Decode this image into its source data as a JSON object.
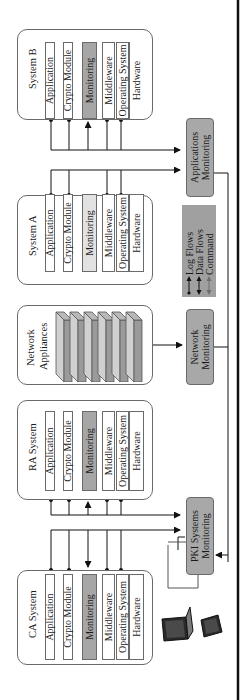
{
  "diagram": {
    "orientation": "rotated-90-ccw",
    "systems": [
      {
        "id": "system_b",
        "title": "System B",
        "layers": [
          "Application",
          "Crypto Module",
          "Monitoring",
          "Middleware",
          "Operating System",
          "Hardware"
        ],
        "monitoring_shade": "dark"
      },
      {
        "id": "system_a",
        "title": "System A",
        "layers": [
          "Application",
          "Crypto Module",
          "Monitoring",
          "Middleware",
          "Operating System",
          "Hardware"
        ],
        "monitoring_shade": "light"
      },
      {
        "id": "network",
        "title_line1": "Network",
        "title_line2": "Appliances",
        "appliance_count": 6
      },
      {
        "id": "ra_system",
        "title": "RA System",
        "layers": [
          "Application",
          "Crypto Module",
          "Monitoring",
          "Middleware",
          "Operating System",
          "Hardware"
        ],
        "monitoring_shade": "dark"
      },
      {
        "id": "ca_system",
        "title": "CA  System",
        "layers": [
          "Application",
          "Crypto Module",
          "Monitoring",
          "Middleware",
          "Operating System",
          "Hardware"
        ],
        "monitoring_shade": "dark"
      }
    ],
    "monitors": {
      "applications": {
        "line1": "Applications",
        "line2": "Monitoring"
      },
      "network": {
        "line1": "Network",
        "line2": "Monitoring"
      },
      "pki": {
        "line1": "PKI Systems",
        "line2": "Monitoring"
      }
    },
    "legend": {
      "items": [
        {
          "label": "Log Flows",
          "arrow": "dot-to-arrow",
          "color": "#111111"
        },
        {
          "label": "Data Flows",
          "arrow": "double-arrow",
          "color": "#111111"
        },
        {
          "label": "Command",
          "arrow": "double-arrow",
          "color": "#6e6e6e"
        }
      ]
    },
    "devices": [
      "laptop-icon",
      "tablet-icon"
    ],
    "colors": {
      "box_fill_dark": "#a6a6a6",
      "box_fill_light": "#e2e2e2",
      "monitor_fill": "#a8a8a8",
      "legend_fill": "#a0a0a0",
      "line": "#111111",
      "border": "#6a6a6a"
    }
  }
}
